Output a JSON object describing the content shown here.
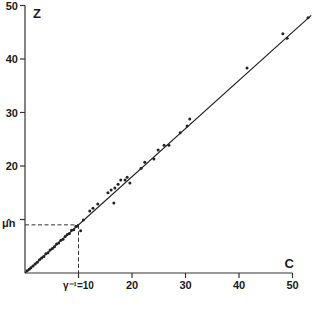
{
  "chart_data": {
    "type": "scatter",
    "title": "",
    "xlabel": "C",
    "ylabel": "Z",
    "xlim": [
      0,
      50
    ],
    "ylim": [
      0,
      50
    ],
    "grid": false,
    "legend": "none",
    "x_ticks": [
      10,
      20,
      30,
      40,
      50
    ],
    "x_tick_labels": [
      "",
      "20",
      "30",
      "40",
      "50"
    ],
    "y_ticks": [
      10,
      20,
      30,
      40,
      50
    ],
    "y_tick_labels": [
      "",
      "20",
      "30",
      "40",
      "50"
    ],
    "annotations": {
      "x_marker_label": "γ⁻¹=10",
      "x_marker_value": 10,
      "y_marker_label": "μ̂n",
      "y_marker_value": 9
    },
    "fit_line": {
      "slope": 0.9,
      "intercept": 0,
      "x_end": 53.5
    },
    "points": [
      [
        0.4,
        0.4
      ],
      [
        0.8,
        0.7
      ],
      [
        1.1,
        1.0
      ],
      [
        1.5,
        1.3
      ],
      [
        1.9,
        1.7
      ],
      [
        2.3,
        2.0
      ],
      [
        2.7,
        2.5
      ],
      [
        3.1,
        2.8
      ],
      [
        3.5,
        3.1
      ],
      [
        3.9,
        3.6
      ],
      [
        4.3,
        3.8
      ],
      [
        4.7,
        4.3
      ],
      [
        5.1,
        4.6
      ],
      [
        5.5,
        4.9
      ],
      [
        5.9,
        5.4
      ],
      [
        6.3,
        5.6
      ],
      [
        6.7,
        6.1
      ],
      [
        7.1,
        6.3
      ],
      [
        7.5,
        6.8
      ],
      [
        7.9,
        7.2
      ],
      [
        8.3,
        7.4
      ],
      [
        8.7,
        8.0
      ],
      [
        9.1,
        8.1
      ],
      [
        9.5,
        8.7
      ],
      [
        9.8,
        8.8
      ],
      [
        10.4,
        7.9
      ],
      [
        10.9,
        9.9
      ],
      [
        12.1,
        11.6
      ],
      [
        12.7,
        12.1
      ],
      [
        13.6,
        12.9
      ],
      [
        15.5,
        15.0
      ],
      [
        16.1,
        15.5
      ],
      [
        16.8,
        15.9
      ],
      [
        17.4,
        16.6
      ],
      [
        17.9,
        17.4
      ],
      [
        19.1,
        17.9
      ],
      [
        16.6,
        13.1
      ],
      [
        18.7,
        17.4
      ],
      [
        19.6,
        16.8
      ],
      [
        21.7,
        19.6
      ],
      [
        22.4,
        20.7
      ],
      [
        24.1,
        21.3
      ],
      [
        24.9,
        23.0
      ],
      [
        26.0,
        23.9
      ],
      [
        26.9,
        23.9
      ],
      [
        29.0,
        26.2
      ],
      [
        30.3,
        27.5
      ],
      [
        30.8,
        28.8
      ],
      [
        41.5,
        38.3
      ],
      [
        48.2,
        44.7
      ],
      [
        49.0,
        43.9
      ],
      [
        52.9,
        47.7
      ]
    ]
  }
}
